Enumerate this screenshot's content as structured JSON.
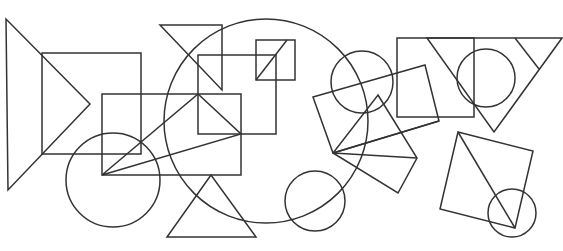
{
  "diagram": {
    "background": "#ffffff",
    "stroke_color": "#333333",
    "stroke_width": 1.5,
    "width": 563,
    "height": 251,
    "shapes": [
      {
        "name": "left-triangle",
        "type": "polygon",
        "points": "6,19 8,190 90,104"
      },
      {
        "name": "left-square",
        "type": "polygon",
        "points": "42,53 141,53 141,154 42,154"
      },
      {
        "name": "left-circle",
        "type": "circle",
        "cx": 113,
        "cy": 180,
        "r": 47
      },
      {
        "name": "center-rectangle",
        "type": "polygon",
        "points": "102,94 241,94 241,175 102,175"
      },
      {
        "name": "center-triangle",
        "type": "polygon",
        "points": "102,175 198,94 241,134"
      },
      {
        "name": "top-triangle",
        "type": "polygon",
        "points": "160,25 222,25 222,90"
      },
      {
        "name": "middle-square",
        "type": "polygon",
        "points": "198,55 276,55 276,134 198,134"
      },
      {
        "name": "small-square",
        "type": "polygon",
        "points": "256,40 295,40 295,80 256,80"
      },
      {
        "name": "small-square-diagonal",
        "type": "line",
        "x1": 256,
        "y1": 80,
        "x2": 287,
        "y2": 40
      },
      {
        "name": "large-circle",
        "type": "circle",
        "cx": 266,
        "cy": 121,
        "r": 102
      },
      {
        "name": "bottom-triangle",
        "type": "polygon",
        "points": "211,175 167,237 256,237"
      },
      {
        "name": "bottom-circle",
        "type": "circle",
        "cx": 315,
        "cy": 201,
        "r": 30
      },
      {
        "name": "upper-right-circle",
        "type": "circle",
        "cx": 362,
        "cy": 82,
        "r": 31
      },
      {
        "name": "tilted-rectangle",
        "type": "polygon",
        "points": "313,97 425,65 439,121 333,153"
      },
      {
        "name": "tilted-rectangle-diagonal",
        "type": "line",
        "x1": 333,
        "y1": 153,
        "x2": 439,
        "y2": 121
      },
      {
        "name": "tilted-square",
        "type": "polygon",
        "points": "378,95 417,158 398,193 333,153"
      },
      {
        "name": "tilted-square-diagonal",
        "type": "line",
        "x1": 333,
        "y1": 153,
        "x2": 417,
        "y2": 158
      },
      {
        "name": "right-square",
        "type": "polygon",
        "points": "397,38 474,38 474,117 397,117"
      },
      {
        "name": "right-triangle",
        "type": "polygon",
        "points": "427,38 562,38 494,132"
      },
      {
        "name": "right-triangle-inner-line",
        "type": "line",
        "x1": 515,
        "y1": 38,
        "x2": 539,
        "y2": 69
      },
      {
        "name": "right-circle",
        "type": "circle",
        "cx": 486,
        "cy": 78,
        "r": 29
      },
      {
        "name": "bottom-right-square",
        "type": "polygon",
        "points": "458,132 533,151 515,228 440,209"
      },
      {
        "name": "bottom-right-square-diagonal",
        "type": "line",
        "x1": 458,
        "y1": 132,
        "x2": 515,
        "y2": 228
      },
      {
        "name": "bottom-right-circle",
        "type": "circle",
        "cx": 512,
        "cy": 213,
        "r": 24
      }
    ]
  }
}
